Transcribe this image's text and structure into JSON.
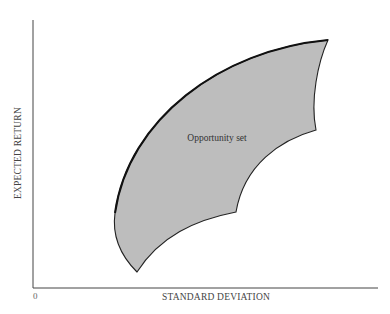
{
  "diagram": {
    "y_axis_label": "EXPECTED RETURN",
    "x_axis_label": "STANDARD DEVIATION",
    "origin_label": "0",
    "region_label": "Opportunity set",
    "colors": {
      "fill": "#bdbdbd",
      "outline": "#222222",
      "axis": "#444444",
      "background": "#ffffff"
    }
  }
}
